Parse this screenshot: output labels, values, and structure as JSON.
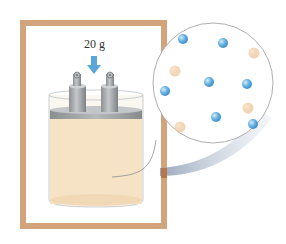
{
  "figure": {
    "mass_label": "20 g",
    "colors": {
      "frame": "#d2a47c",
      "sand_fill": "#f6e3c6",
      "lid": "#9a9d9f",
      "piston": "#a7aaac",
      "arrow": "#5aa6d8",
      "particle_blue": "#6fb8e6",
      "particle_tan": "#f0c89a",
      "magnifier_outline": "#999999"
    },
    "particles": {
      "blue": [
        {
          "x": 183,
          "y": 39
        },
        {
          "x": 223,
          "y": 43
        },
        {
          "x": 209,
          "y": 82
        },
        {
          "x": 165,
          "y": 91
        },
        {
          "x": 247,
          "y": 84
        },
        {
          "x": 216,
          "y": 117
        },
        {
          "x": 253,
          "y": 124
        }
      ],
      "tan": [
        {
          "x": 254,
          "y": 53
        },
        {
          "x": 175,
          "y": 71
        },
        {
          "x": 248,
          "y": 108
        },
        {
          "x": 180,
          "y": 127
        }
      ]
    }
  }
}
